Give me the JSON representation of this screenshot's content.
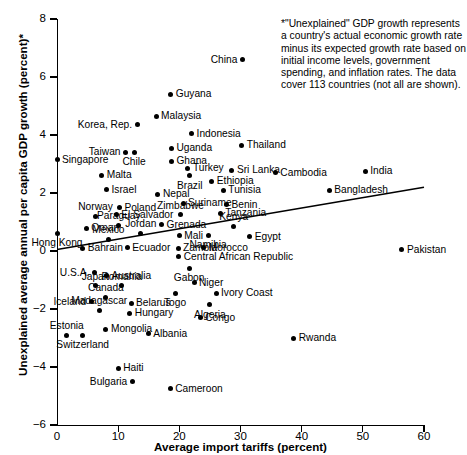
{
  "chart_data": {
    "type": "scatter",
    "title": "",
    "xlabel": "Average import tariffs (percent)",
    "ylabel": "Unexplained average annual per capita GDP growth (percent)*",
    "xlim": [
      0,
      60
    ],
    "ylim": [
      -6,
      8
    ],
    "xticks": [
      0,
      10,
      20,
      30,
      40,
      50,
      60
    ],
    "yticks": [
      -6,
      -4,
      -2,
      0,
      2,
      4,
      6,
      8
    ],
    "grid": false,
    "legend": null,
    "annotation": "*\"Unexplained\" GDP growth represents a country's actual economic growth rate minus its expected growth rate based on initial income levels, government spending, and inflation rates. The data cover 113 countries (not all are shown).",
    "trendline": {
      "x0": 0,
      "y0": 0.05,
      "x1": 60,
      "y1": 2.2
    },
    "points": [
      {
        "label": "China",
        "x": 30.3,
        "y": 6.6,
        "pos": "r"
      },
      {
        "label": "Guyana",
        "x": 18.6,
        "y": 5.4,
        "pos": "l"
      },
      {
        "label": "Malaysia",
        "x": 16.2,
        "y": 4.65,
        "pos": "l"
      },
      {
        "label": "Korea, Rep.",
        "x": 13.1,
        "y": 4.35,
        "pos": "r"
      },
      {
        "label": "Indonesia",
        "x": 22.0,
        "y": 4.05,
        "pos": "l"
      },
      {
        "label": "Thailand",
        "x": 30.2,
        "y": 3.65,
        "pos": "l"
      },
      {
        "label": "Uganda",
        "x": 18.7,
        "y": 3.55,
        "pos": "l"
      },
      {
        "label": "Taiwan",
        "x": 11.2,
        "y": 3.4,
        "pos": "r"
      },
      {
        "label": "Chile",
        "x": 12.6,
        "y": 3.4,
        "pos": "below"
      },
      {
        "label": "Ghana",
        "x": 18.7,
        "y": 3.1,
        "pos": "l"
      },
      {
        "label": "Singapore",
        "x": 0.0,
        "y": 3.15,
        "pos": "l"
      },
      {
        "label": "Sri Lanka",
        "x": 28.6,
        "y": 2.78,
        "pos": "l"
      },
      {
        "label": "Cambodia",
        "x": 35.7,
        "y": 2.7,
        "pos": "l"
      },
      {
        "label": "India",
        "x": 50.4,
        "y": 2.75,
        "pos": "l"
      },
      {
        "label": "Turkey",
        "x": 21.4,
        "y": 2.85,
        "pos": "l"
      },
      {
        "label": "Brazil",
        "x": 21.7,
        "y": 2.6,
        "pos": "below"
      },
      {
        "label": "Malta",
        "x": 7.3,
        "y": 2.62,
        "pos": "l"
      },
      {
        "label": "Ethiopia",
        "x": 25.3,
        "y": 2.4,
        "pos": "l"
      },
      {
        "label": "Tunisia",
        "x": 27.2,
        "y": 2.1,
        "pos": "l"
      },
      {
        "label": "Bangladesh",
        "x": 44.5,
        "y": 2.1,
        "pos": "l"
      },
      {
        "label": "Israel",
        "x": 8.1,
        "y": 2.12,
        "pos": "l"
      },
      {
        "label": "Nepal",
        "x": 16.5,
        "y": 1.95,
        "pos": "l"
      },
      {
        "label": "Suriname",
        "x": 20.6,
        "y": 1.65,
        "pos": "l"
      },
      {
        "label": "Benin",
        "x": 27.7,
        "y": 1.6,
        "pos": "l"
      },
      {
        "label": "Poland",
        "x": 10.2,
        "y": 1.5,
        "pos": "l"
      },
      {
        "label": "Norway",
        "x": 6.3,
        "y": 1.2,
        "pos": "above"
      },
      {
        "label": "El Salvador",
        "x": 9.7,
        "y": 1.25,
        "pos": "l"
      },
      {
        "label": "Zimbabwe",
        "x": 20.2,
        "y": 1.25,
        "pos": "above"
      },
      {
        "label": "Tanzania",
        "x": 26.7,
        "y": 1.3,
        "pos": "l"
      },
      {
        "label": "Paraguay",
        "x": 10.1,
        "y": 0.88,
        "pos": "above"
      },
      {
        "label": "Grenada",
        "x": 17.1,
        "y": 0.9,
        "pos": "l"
      },
      {
        "label": "Kenya",
        "x": 28.9,
        "y": 0.85,
        "pos": "above"
      },
      {
        "label": "Oman",
        "x": 4.8,
        "y": 0.78,
        "pos": "l"
      },
      {
        "label": "Hong Kong",
        "x": 0.0,
        "y": 0.62,
        "pos": "below"
      },
      {
        "label": "Jordan",
        "x": 13.7,
        "y": 0.62,
        "pos": "above"
      },
      {
        "label": "Mali",
        "x": 20.0,
        "y": 0.52,
        "pos": "l"
      },
      {
        "label": "Namibia",
        "x": 24.7,
        "y": 0.55,
        "pos": "below"
      },
      {
        "label": "Egypt",
        "x": 31.5,
        "y": 0.5,
        "pos": "l"
      },
      {
        "label": "Mexico",
        "x": 8.4,
        "y": 0.4,
        "pos": "above"
      },
      {
        "label": "Bahrain",
        "x": 4.2,
        "y": 0.1,
        "pos": "l"
      },
      {
        "label": "Ecuador",
        "x": 11.5,
        "y": 0.12,
        "pos": "l"
      },
      {
        "label": "Zambia",
        "x": 19.8,
        "y": 0.1,
        "pos": "l"
      },
      {
        "label": "Morocco",
        "x": 24.0,
        "y": 0.12,
        "pos": "l"
      },
      {
        "label": "Pakistan",
        "x": 56.4,
        "y": 0.05,
        "pos": "l"
      },
      {
        "label": "Central African Republic",
        "x": 19.9,
        "y": -0.2,
        "pos": "l"
      },
      {
        "label": "U.S.A.",
        "x": 6.1,
        "y": -0.75,
        "pos": "r"
      },
      {
        "label": "Australia",
        "x": 8.1,
        "y": -0.85,
        "pos": "l"
      },
      {
        "label": "Gabon",
        "x": 21.6,
        "y": -0.6,
        "pos": "below"
      },
      {
        "label": "Japan",
        "x": 6.3,
        "y": -1.2,
        "pos": "above"
      },
      {
        "label": "Romania",
        "x": 10.6,
        "y": -1.2,
        "pos": "above"
      },
      {
        "label": "Niger",
        "x": 22.4,
        "y": -1.1,
        "pos": "l"
      },
      {
        "label": "Canada",
        "x": 8.0,
        "y": -1.6,
        "pos": "above"
      },
      {
        "label": "Togo",
        "x": 19.3,
        "y": -1.45,
        "pos": "below"
      },
      {
        "label": "Ivory Coast",
        "x": 26.0,
        "y": -1.45,
        "pos": "l"
      },
      {
        "label": "Iceland",
        "x": 5.6,
        "y": -1.75,
        "pos": "r"
      },
      {
        "label": "Belarus",
        "x": 12.1,
        "y": -1.8,
        "pos": "l"
      },
      {
        "label": "Algeria",
        "x": 25.0,
        "y": -1.85,
        "pos": "below"
      },
      {
        "label": "Madagascar",
        "x": 6.9,
        "y": -2.05,
        "pos": "above"
      },
      {
        "label": "Hungary",
        "x": 11.9,
        "y": -2.15,
        "pos": "l"
      },
      {
        "label": "Congo",
        "x": 23.4,
        "y": -2.3,
        "pos": "l"
      },
      {
        "label": "Estonia",
        "x": 1.6,
        "y": -2.9,
        "pos": "above"
      },
      {
        "label": "Mongolia",
        "x": 8.0,
        "y": -2.7,
        "pos": "l"
      },
      {
        "label": "Albania",
        "x": 14.9,
        "y": -2.85,
        "pos": "l"
      },
      {
        "label": "Switzerland",
        "x": 4.2,
        "y": -2.9,
        "pos": "below"
      },
      {
        "label": "Haiti",
        "x": 10.0,
        "y": -4.05,
        "pos": "l"
      },
      {
        "label": "Bulgaria",
        "x": 12.3,
        "y": -4.5,
        "pos": "r"
      },
      {
        "label": "Cameroon",
        "x": 18.5,
        "y": -4.75,
        "pos": "l"
      },
      {
        "label": "Rwanda",
        "x": 38.7,
        "y": -3.0,
        "pos": "l"
      }
    ]
  }
}
